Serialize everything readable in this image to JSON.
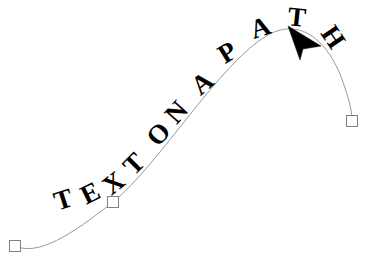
{
  "document": {
    "title": "TEXT ON A PATH",
    "background_color": "#ffffff"
  },
  "artwork": {
    "text_on_path": {
      "string": "TEXT ON A PATH",
      "fill_color": "#000000",
      "font_style": "bold serif",
      "letters": [
        {
          "char": "T",
          "x": 66,
          "y": 208,
          "rotate": -18,
          "size": 27
        },
        {
          "char": "E",
          "x": 94,
          "y": 201,
          "rotate": -26,
          "size": 27
        },
        {
          "char": "X",
          "x": 119,
          "y": 190,
          "rotate": -38,
          "size": 27
        },
        {
          "char": "T",
          "x": 140,
          "y": 170,
          "rotate": -45,
          "size": 27
        },
        {
          "char": "O",
          "x": 165,
          "y": 140,
          "rotate": -48,
          "size": 27
        },
        {
          "char": "N",
          "x": 183,
          "y": 118,
          "rotate": -48,
          "size": 27
        },
        {
          "char": "A",
          "x": 208,
          "y": 90,
          "rotate": -40,
          "size": 27
        },
        {
          "char": "P",
          "x": 232,
          "y": 60,
          "rotate": -32,
          "size": 27
        },
        {
          "char": "A",
          "x": 263,
          "y": 36,
          "rotate": -18,
          "size": 27
        },
        {
          "char": "T",
          "x": 296,
          "y": 26,
          "rotate": 6,
          "size": 27
        },
        {
          "char": "H",
          "x": 326,
          "y": 42,
          "rotate": 56,
          "size": 27
        }
      ]
    },
    "path": {
      "stroke_color": "#999999",
      "stroke_width": 1,
      "fill": "none",
      "d": "M 15 246 C 38 256 70 236 113 202 C 160 164 220 62 268 35 C 300 17 330 40 345 88 C 350 103 352 112 352 121"
    },
    "node_handles": [
      {
        "name": "start-node",
        "x": 15,
        "y": 246,
        "size": 11,
        "fill": "#ffffff",
        "stroke": "#808080"
      },
      {
        "name": "middle-node",
        "x": 113,
        "y": 202,
        "size": 11,
        "fill": "#ffffff",
        "stroke": "#808080"
      },
      {
        "name": "end-node",
        "x": 352,
        "y": 121,
        "size": 11,
        "fill": "#ffffff",
        "stroke": "#808080"
      }
    ],
    "cursor": {
      "type": "arrow-pointer",
      "tip_x": 288,
      "tip_y": 26,
      "fill": "#000000"
    }
  }
}
